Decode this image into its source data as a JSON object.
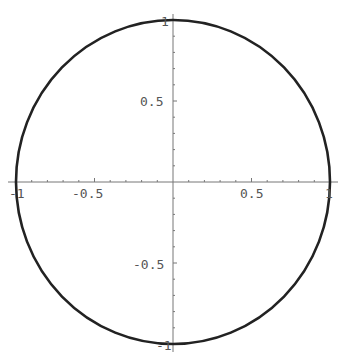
{
  "chart_data": {
    "type": "line",
    "title": "",
    "xlabel": "",
    "ylabel": "",
    "xlim": [
      -1,
      1
    ],
    "ylim": [
      -1,
      1
    ],
    "grid": false,
    "legend": null,
    "x_ticks": [
      -1,
      -0.5,
      0.5,
      1
    ],
    "x_tick_labels": [
      "-1",
      "-0.5",
      "0.5",
      "1"
    ],
    "y_ticks": [
      -1,
      -0.5,
      0.5,
      1
    ],
    "y_tick_labels": [
      "-1",
      "-0.5",
      "0.5",
      "1"
    ],
    "minor_tick_step": 0.1,
    "series": [
      {
        "name": "unit circle",
        "color": "#222222",
        "x": [
          1,
          0.866,
          0.5,
          0,
          -0.5,
          -0.866,
          -1,
          -0.866,
          -0.5,
          0,
          0.5,
          0.866,
          1
        ],
        "y": [
          0,
          0.5,
          0.866,
          1,
          0.866,
          0.5,
          0,
          -0.5,
          -0.866,
          -1,
          -0.866,
          -0.5,
          0
        ]
      }
    ]
  },
  "labels": {
    "x_neg1": "-1",
    "x_neg05": "-0.5",
    "x_pos05": "0.5",
    "x_pos1": "1",
    "y_pos1": "1",
    "y_pos05": "0.5",
    "y_neg05": "-0.5",
    "y_neg1": "-1"
  },
  "colors": {
    "curve": "#222222",
    "axis": "#777777",
    "tick_label": "#555555",
    "background": "#ffffff"
  }
}
